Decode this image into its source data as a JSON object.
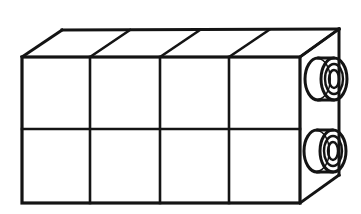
{
  "figure": {
    "title": "Cuboid block with two cylindrical hubs",
    "colors": {
      "background": "#ffffff",
      "line": "#141414",
      "fill": "#ffffff"
    },
    "view": "oblique-cabinet-projection",
    "canvas": {
      "width": 361,
      "height": 214
    }
  },
  "geometry": {
    "front_face": {
      "name": "front-face",
      "left": 22,
      "right": 300,
      "top": 57,
      "bottom": 203,
      "columns": 4,
      "rows": 2,
      "cell_count": 8,
      "vertical_divider_x": [
        90,
        160,
        229
      ],
      "horizontal_divider_y": [
        129
      ]
    },
    "depth_offset": {
      "dx": 40,
      "dy": -28
    },
    "top_face": {
      "name": "top-face",
      "front_left": {
        "x": 22,
        "y": 57
      },
      "front_right": {
        "x": 300,
        "y": 57
      },
      "back_right": {
        "x": 339,
        "y": 29
      },
      "back_left": {
        "x": 62,
        "y": 30
      },
      "diagonal_count": 4
    },
    "right_face": {
      "name": "right-side-face",
      "front_top": {
        "x": 300,
        "y": 57
      },
      "back_top": {
        "x": 339,
        "y": 29
      },
      "back_bottom": {
        "x": 339,
        "y": 175
      },
      "front_bottom": {
        "x": 300,
        "y": 203
      }
    },
    "hubs": [
      {
        "name": "upper-hub",
        "label": "upper cylindrical boss",
        "barrel_back_cx": 318,
        "barrel_front_cx": 334,
        "cy": 79,
        "rx": 13,
        "ry": 21,
        "inner_rx": 9,
        "inner_ry": 15,
        "bore_rx": 5,
        "bore_ry": 9
      },
      {
        "name": "lower-hub",
        "label": "lower cylindrical boss",
        "barrel_back_cx": 317,
        "barrel_front_cx": 333,
        "cy": 151,
        "rx": 13,
        "ry": 21,
        "inner_rx": 9,
        "inner_ry": 15,
        "bore_rx": 5,
        "bore_ry": 9
      }
    ]
  },
  "stroke_widths": {
    "outline": 3.2,
    "divider": 2.6,
    "hub_outer": 3.0,
    "hub_inner": 2.4
  }
}
